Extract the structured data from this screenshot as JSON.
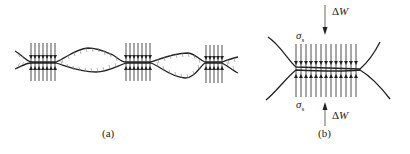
{
  "figure": {
    "panel_a": {
      "caption": "(a)",
      "description": "Rough surfaces in contact at three asperity junctions with compressive stress arrows"
    },
    "panel_b": {
      "caption": "(b)",
      "load_top": {
        "symbol": "Δ",
        "var": "W"
      },
      "load_bottom": {
        "symbol": "Δ",
        "var": "W"
      },
      "stress_top": {
        "symbol": "σ",
        "sub": "s"
      },
      "stress_bottom": {
        "symbol": "σ",
        "sub": "s"
      }
    }
  },
  "colors": {
    "line": "#222222",
    "hatch": "#888888",
    "background": "#ffffff"
  }
}
